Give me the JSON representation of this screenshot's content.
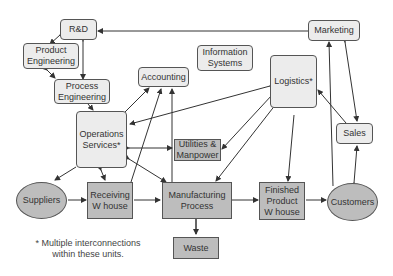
{
  "diagram": {
    "nodes": {
      "rd": "R&D",
      "product_engineering": "Product\nEngineering",
      "process_engineering": "Process\nEngineering",
      "accounting": "Accounting",
      "information_systems": "Information\nSystems",
      "logistics": "Logistics*",
      "marketing": "Marketing",
      "operations_services": "Operations\nServices*",
      "utilities_manpower": "Utilities &\nManpower",
      "sales": "Sales",
      "suppliers": "Suppliers",
      "receiving_warehouse": "Receiving\nW house",
      "manufacturing_process": "Manufacturing\nProcess",
      "finished_product_warehouse": "Finished\nProduct\nW house",
      "customers": "Customers",
      "waste": "Waste"
    },
    "footnote": "* Multiple interconnections\nwithin these units.",
    "colors": {
      "light_box": "#ececec",
      "dark_box": "#bdbdbd",
      "border": "#555555",
      "line": "#333333"
    }
  }
}
